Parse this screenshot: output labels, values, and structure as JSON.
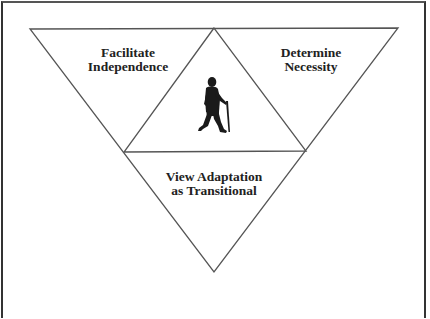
{
  "diagram": {
    "sections": [
      {
        "id": "facilitate",
        "lines": [
          "Facilitate",
          "Independence"
        ]
      },
      {
        "id": "determine",
        "lines": [
          "Determine",
          "Necessity"
        ]
      },
      {
        "id": "view",
        "lines": [
          "View Adaptation",
          "as Transitional"
        ]
      }
    ],
    "center_icon": "person-walking-with-cane-icon"
  },
  "colors": {
    "line": "#555555",
    "text": "#222222",
    "figure": "#1a1a1a",
    "background": "#ffffff"
  }
}
